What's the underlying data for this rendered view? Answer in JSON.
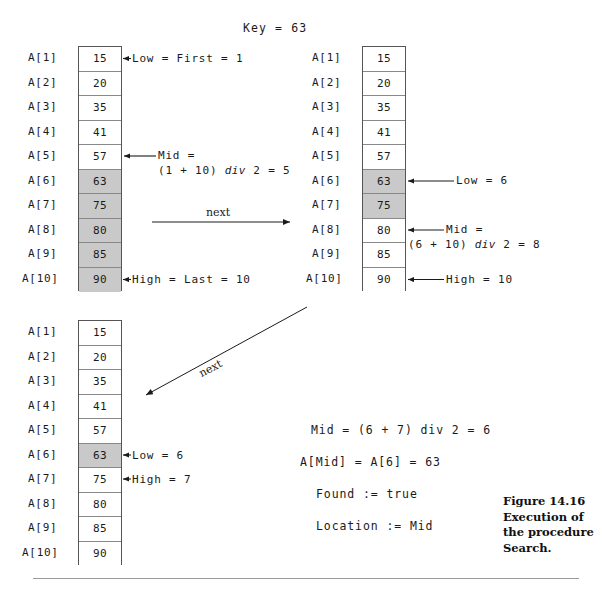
{
  "figure": {
    "title": "Key  =  63",
    "caption": "Figure 14.16\nExecution of\nthe procedure\nSearch.",
    "colors": {
      "shaded_cell": "#c9c9c9",
      "border": "#555555",
      "text": "#1a1a1a"
    }
  },
  "labels": {
    "next_horizontal": "next",
    "next_diagonal": "next"
  },
  "arrays": [
    {
      "id": "array-step-1",
      "index_labels": [
        "A[1]",
        "A[2]",
        "A[3]",
        "A[4]",
        "A[5]",
        "A[6]",
        "A[7]",
        "A[8]",
        "A[9]",
        "A[10]"
      ],
      "values": [
        "15",
        "20",
        "35",
        "41",
        "57",
        "63",
        "75",
        "80",
        "85",
        "90"
      ],
      "shaded": [
        false,
        false,
        false,
        false,
        false,
        true,
        true,
        true,
        true,
        true
      ],
      "annotations": [
        {
          "name": "low-annotation",
          "row": 1,
          "text": "Low  =  First  =  1"
        },
        {
          "name": "mid-annotation",
          "row": 5,
          "line1": "Mid  =",
          "line2_pre": "(1  +  10)  ",
          "line2_ital": "div",
          "line2_post": " 2  =  5"
        },
        {
          "name": "high-annotation",
          "row": 10,
          "text": "High  =  Last  =  10"
        }
      ]
    },
    {
      "id": "array-step-2",
      "index_labels": [
        "A[1]",
        "A[2]",
        "A[3]",
        "A[4]",
        "A[5]",
        "A[6]",
        "A[7]",
        "A[8]",
        "A[9]",
        "A[10]"
      ],
      "values": [
        "15",
        "20",
        "35",
        "41",
        "57",
        "63",
        "75",
        "80",
        "85",
        "90"
      ],
      "shaded": [
        false,
        false,
        false,
        false,
        false,
        true,
        true,
        false,
        false,
        false
      ],
      "annotations": [
        {
          "name": "low-annotation",
          "row": 6,
          "text": "Low  =  6"
        },
        {
          "name": "mid-annotation",
          "row": 8,
          "line1": "Mid  =",
          "line2_pre": "(6  +  10)  ",
          "line2_ital": "div",
          "line2_post": " 2  =  8"
        },
        {
          "name": "high-annotation",
          "row": 10,
          "text": "High  =  10"
        }
      ]
    },
    {
      "id": "array-step-3",
      "index_labels": [
        "A[1]",
        "A[2]",
        "A[3]",
        "A[4]",
        "A[5]",
        "A[6]",
        "A[7]",
        "A[8]",
        "A[9]",
        "A[10]"
      ],
      "values": [
        "15",
        "20",
        "35",
        "41",
        "57",
        "63",
        "75",
        "80",
        "85",
        "90"
      ],
      "shaded": [
        false,
        false,
        false,
        false,
        false,
        true,
        false,
        false,
        false,
        false
      ],
      "annotations": [
        {
          "name": "low-annotation",
          "row": 6,
          "text": "Low  =  6"
        },
        {
          "name": "high-annotation",
          "row": 7,
          "text": "High  =  7"
        }
      ]
    }
  ],
  "result_lines": {
    "mid_pre": "Mid  =  (6  +  7)  ",
    "mid_ital": "div",
    "mid_post": " 2  =  6",
    "amid": "A[Mid]  =  A[6]  =  63",
    "found": "Found  :=  true",
    "location": "Location  :=  Mid"
  }
}
